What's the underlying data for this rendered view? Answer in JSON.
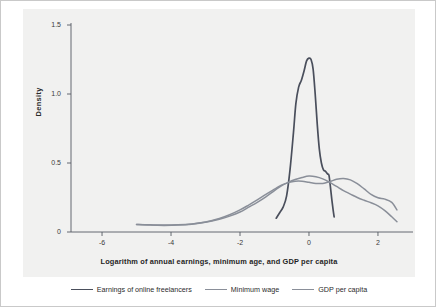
{
  "chart_data": {
    "type": "line",
    "title": "",
    "xlabel": "Logarithm of annual earnings, minimum age, and GDP per capita",
    "ylabel": "Density",
    "xlim": [
      -6.9,
      2.9
    ],
    "ylim": [
      0,
      1.5
    ],
    "xticks": [
      "-6",
      "-4",
      "-2",
      "0",
      "2"
    ],
    "xtick_values": [
      -6,
      -4,
      -2,
      0,
      2
    ],
    "yticks": [
      "0",
      "0.5",
      "1.0",
      "1.5"
    ],
    "ytick_values": [
      0,
      0.5,
      1.0,
      1.5
    ],
    "grid": false,
    "legend_position": "below",
    "series": [
      {
        "name": "Earnings of online freelancers",
        "color": "#4a4f5c",
        "width": 1.7,
        "points": [
          [
            -0.95,
            0.1
          ],
          [
            -0.85,
            0.14
          ],
          [
            -0.75,
            0.18
          ],
          [
            -0.65,
            0.26
          ],
          [
            -0.55,
            0.45
          ],
          [
            -0.45,
            0.72
          ],
          [
            -0.38,
            0.93
          ],
          [
            -0.3,
            1.05
          ],
          [
            -0.22,
            1.1
          ],
          [
            -0.14,
            1.17
          ],
          [
            -0.07,
            1.24
          ],
          [
            0.0,
            1.26
          ],
          [
            0.06,
            1.25
          ],
          [
            0.12,
            1.18
          ],
          [
            0.18,
            1.0
          ],
          [
            0.24,
            0.78
          ],
          [
            0.3,
            0.6
          ],
          [
            0.36,
            0.5
          ],
          [
            0.42,
            0.45
          ],
          [
            0.48,
            0.44
          ],
          [
            0.54,
            0.42
          ],
          [
            0.58,
            0.41
          ],
          [
            0.62,
            0.33
          ],
          [
            0.66,
            0.24
          ],
          [
            0.7,
            0.16
          ],
          [
            0.73,
            0.11
          ]
        ]
      },
      {
        "name": "Minimum wage",
        "color": "#8a8f99",
        "width": 1.5,
        "points": [
          [
            -5.0,
            0.055
          ],
          [
            -4.6,
            0.052
          ],
          [
            -4.2,
            0.05
          ],
          [
            -3.8,
            0.052
          ],
          [
            -3.4,
            0.058
          ],
          [
            -3.0,
            0.07
          ],
          [
            -2.6,
            0.092
          ],
          [
            -2.3,
            0.115
          ],
          [
            -2.0,
            0.145
          ],
          [
            -1.75,
            0.18
          ],
          [
            -1.5,
            0.215
          ],
          [
            -1.25,
            0.255
          ],
          [
            -1.0,
            0.3
          ],
          [
            -0.8,
            0.335
          ],
          [
            -0.6,
            0.36
          ],
          [
            -0.4,
            0.38
          ],
          [
            -0.2,
            0.395
          ],
          [
            0.0,
            0.405
          ],
          [
            0.2,
            0.4
          ],
          [
            0.4,
            0.385
          ],
          [
            0.6,
            0.36
          ],
          [
            0.8,
            0.33
          ],
          [
            1.0,
            0.3
          ],
          [
            1.2,
            0.275
          ],
          [
            1.4,
            0.25
          ],
          [
            1.6,
            0.23
          ],
          [
            1.8,
            0.212
          ],
          [
            2.0,
            0.19
          ],
          [
            2.2,
            0.155
          ],
          [
            2.4,
            0.11
          ],
          [
            2.55,
            0.075
          ]
        ]
      },
      {
        "name": "GDP per capita",
        "color": "#8a8f99",
        "width": 1.5,
        "points": [
          [
            -5.0,
            0.055
          ],
          [
            -4.6,
            0.05
          ],
          [
            -4.2,
            0.048
          ],
          [
            -3.8,
            0.05
          ],
          [
            -3.4,
            0.057
          ],
          [
            -3.0,
            0.072
          ],
          [
            -2.6,
            0.098
          ],
          [
            -2.3,
            0.125
          ],
          [
            -2.0,
            0.16
          ],
          [
            -1.75,
            0.195
          ],
          [
            -1.5,
            0.232
          ],
          [
            -1.25,
            0.272
          ],
          [
            -1.0,
            0.31
          ],
          [
            -0.8,
            0.34
          ],
          [
            -0.6,
            0.358
          ],
          [
            -0.4,
            0.368
          ],
          [
            -0.2,
            0.368
          ],
          [
            0.0,
            0.36
          ],
          [
            0.2,
            0.352
          ],
          [
            0.4,
            0.352
          ],
          [
            0.6,
            0.365
          ],
          [
            0.8,
            0.382
          ],
          [
            1.0,
            0.388
          ],
          [
            1.2,
            0.378
          ],
          [
            1.4,
            0.35
          ],
          [
            1.6,
            0.312
          ],
          [
            1.8,
            0.272
          ],
          [
            2.0,
            0.248
          ],
          [
            2.2,
            0.238
          ],
          [
            2.4,
            0.215
          ],
          [
            2.55,
            0.16
          ]
        ]
      }
    ],
    "annotations": []
  },
  "legend": {
    "items": [
      {
        "label": "Earnings of online freelancers"
      },
      {
        "label": "Minimum wage"
      },
      {
        "label": "GDP per capita"
      }
    ]
  },
  "colors": {
    "plot_background": "#f1f1f0",
    "figure_background": "#ffffff",
    "axis": "#555a62",
    "border": "#c9c9c9",
    "series_dark": "#4a4f5c",
    "series_gray": "#8a8f99"
  }
}
